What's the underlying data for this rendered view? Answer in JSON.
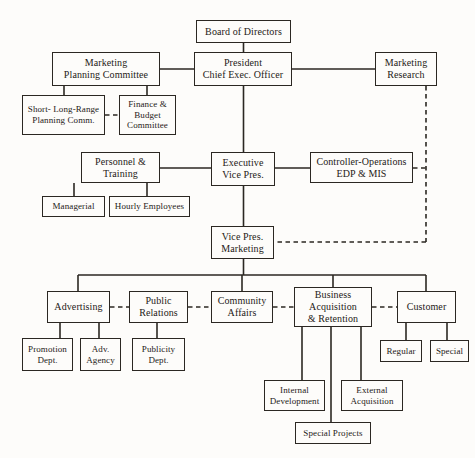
{
  "diagram": {
    "type": "organization-chart",
    "canvas": {
      "width": 475,
      "height": 458
    },
    "colors": {
      "background": "#fdfcfa",
      "line": "#2b2722",
      "text": "#1d1a17",
      "box_fill": "#fdfcfa"
    },
    "line_styles": {
      "solid": "solid reporting line",
      "dashed": "dashed coordination / staff line"
    }
  },
  "nodes": {
    "board_of_directors": {
      "label": "Board of Directors",
      "x": 196,
      "y": 20,
      "w": 95,
      "h": 23,
      "font": "fs-10"
    },
    "president": {
      "label": "President\nChief Exec. Officer",
      "x": 194,
      "y": 52,
      "w": 98,
      "h": 34,
      "font": "fs-10"
    },
    "marketing_planning_committee": {
      "label": "Marketing\nPlanning Committee",
      "x": 52,
      "y": 52,
      "w": 108,
      "h": 34,
      "font": "fs-10"
    },
    "marketing_research": {
      "label": "Marketing\nResearch",
      "x": 375,
      "y": 52,
      "w": 62,
      "h": 34,
      "font": "fs-10"
    },
    "short_long_range_planning": {
      "label": "Short- Long-Range\nPlanning Comm.",
      "x": 22,
      "y": 95,
      "w": 83,
      "h": 40,
      "font": "fs-9"
    },
    "finance_budget_committee": {
      "label": "Finance &\nBudget\nCommittee",
      "x": 119,
      "y": 95,
      "w": 57,
      "h": 40,
      "font": "fs-9"
    },
    "personnel_training": {
      "label": "Personnel &\nTraining",
      "x": 81,
      "y": 152,
      "w": 79,
      "h": 31,
      "font": "fs-10"
    },
    "executive_vice_pres": {
      "label": "Executive\nVice Pres.",
      "x": 211,
      "y": 152,
      "w": 64,
      "h": 34,
      "font": "fs-10"
    },
    "controller_operations": {
      "label": "Controller-Operations\nEDP & MIS",
      "x": 310,
      "y": 152,
      "w": 103,
      "h": 31,
      "font": "fs-10"
    },
    "managerial": {
      "label": "Managerial",
      "x": 42,
      "y": 196,
      "w": 63,
      "h": 21,
      "font": "fs-9"
    },
    "hourly_employees": {
      "label": "Hourly Employees",
      "x": 109,
      "y": 196,
      "w": 81,
      "h": 21,
      "font": "fs-9"
    },
    "vice_pres_marketing": {
      "label": "Vice Pres.\nMarketing",
      "x": 211,
      "y": 226,
      "w": 63,
      "h": 33,
      "font": "fs-10"
    },
    "advertising": {
      "label": "Advertising",
      "x": 47,
      "y": 291,
      "w": 63,
      "h": 32,
      "font": "fs-10"
    },
    "public_relations": {
      "label": "Public\nRelations",
      "x": 129,
      "y": 291,
      "w": 59,
      "h": 32,
      "font": "fs-10"
    },
    "community_affairs": {
      "label": "Community\nAffairs",
      "x": 211,
      "y": 291,
      "w": 62,
      "h": 32,
      "font": "fs-10"
    },
    "business_acquisition_retention": {
      "label": "Business\nAcquisition\n& Retention",
      "x": 294,
      "y": 287,
      "w": 78,
      "h": 40,
      "font": "fs-10"
    },
    "customer": {
      "label": "Customer",
      "x": 397,
      "y": 291,
      "w": 59,
      "h": 32,
      "font": "fs-10"
    },
    "promotion_dept": {
      "label": "Promotion\nDept.",
      "x": 22,
      "y": 338,
      "w": 51,
      "h": 33,
      "font": "fs-9"
    },
    "adv_agency": {
      "label": "Adv.\nAgency",
      "x": 80,
      "y": 338,
      "w": 41,
      "h": 33,
      "font": "fs-9"
    },
    "publicity_dept": {
      "label": "Publicity\nDept.",
      "x": 132,
      "y": 338,
      "w": 53,
      "h": 33,
      "font": "fs-9"
    },
    "regular": {
      "label": "Regular",
      "x": 380,
      "y": 340,
      "w": 42,
      "h": 22,
      "font": "fs-9"
    },
    "special": {
      "label": "Special",
      "x": 430,
      "y": 340,
      "w": 39,
      "h": 22,
      "font": "fs-9"
    },
    "internal_development": {
      "label": "Internal\nDevelopment",
      "x": 264,
      "y": 380,
      "w": 61,
      "h": 31,
      "font": "fs-9"
    },
    "external_acquisition": {
      "label": "External\nAcquisition",
      "x": 341,
      "y": 380,
      "w": 62,
      "h": 31,
      "font": "fs-9"
    },
    "special_projects": {
      "label": "Special Projects",
      "x": 295,
      "y": 422,
      "w": 76,
      "h": 22,
      "font": "fs-9"
    }
  },
  "edges": [
    {
      "name": "board-to-president",
      "style": "solid",
      "d": "M 243.5 43 L 243.5 52"
    },
    {
      "name": "president-to-marketing-planning-committee",
      "style": "solid",
      "d": "M 194 69 L 160 69"
    },
    {
      "name": "president-to-marketing-research",
      "style": "solid",
      "d": "M 292 69 L 375 69"
    },
    {
      "name": "marketing-planning-to-short-long-range",
      "style": "solid",
      "d": "M 64 86 L 64 95"
    },
    {
      "name": "marketing-planning-to-finance-budget",
      "style": "solid",
      "d": "M 147 86 L 147 95"
    },
    {
      "name": "short-long-range-to-finance-budget",
      "style": "dashed",
      "d": "M 105 115 L 119 115"
    },
    {
      "name": "president-to-executive-vice-pres",
      "style": "solid",
      "d": "M 243.5 86 L 243.5 152"
    },
    {
      "name": "executive-vp-to-personnel-training",
      "style": "solid",
      "d": "M 211 168 L 160 168"
    },
    {
      "name": "executive-vp-to-controller-operations",
      "style": "solid",
      "d": "M 275 168 L 310 168"
    },
    {
      "name": "personnel-to-managerial",
      "style": "solid",
      "d": "M 74 183 L 74 196"
    },
    {
      "name": "personnel-to-hourly-employees",
      "style": "solid",
      "d": "M 147 183 L 147 196"
    },
    {
      "name": "executive-vp-to-vice-pres-marketing",
      "style": "solid",
      "d": "M 243.5 186 L 243.5 226"
    },
    {
      "name": "marketing-research-dashed-down",
      "style": "dashed",
      "d": "M 426 86 L 426 242"
    },
    {
      "name": "controller-operations-to-dashed-trunk",
      "style": "dashed",
      "d": "M 413 168 L 426 168"
    },
    {
      "name": "dashed-trunk-to-vice-pres-marketing",
      "style": "dashed",
      "d": "M 426 242 L 274 242"
    },
    {
      "name": "vice-pres-marketing-to-bus",
      "style": "solid",
      "d": "M 243.5 259 L 243.5 275"
    },
    {
      "name": "bus-bar",
      "style": "solid",
      "d": "M 78 275 L 426 275"
    },
    {
      "name": "bus-to-advertising",
      "style": "solid",
      "d": "M 78 275 L 78 291"
    },
    {
      "name": "bus-to-community-affairs",
      "style": "solid",
      "d": "M 242 275 L 242 291"
    },
    {
      "name": "bus-to-business-acquisition",
      "style": "solid",
      "d": "M 333 275 L 333 287"
    },
    {
      "name": "bus-to-customer",
      "style": "solid",
      "d": "M 426 275 L 426 291"
    },
    {
      "name": "advertising-to-public-relations",
      "style": "dashed",
      "d": "M 110 307 L 129 307"
    },
    {
      "name": "public-relations-to-community-affairs",
      "style": "dashed",
      "d": "M 188 307 L 211 307"
    },
    {
      "name": "community-affairs-to-business-acquisition",
      "style": "dashed",
      "d": "M 273 307 L 294 307"
    },
    {
      "name": "business-acquisition-to-customer",
      "style": "dashed",
      "d": "M 372 307 L 397 307"
    },
    {
      "name": "advertising-to-promotion-dept",
      "style": "solid",
      "d": "M 60 323 L 60 338"
    },
    {
      "name": "advertising-to-adv-agency",
      "style": "solid",
      "d": "M 99 323 L 99 338"
    },
    {
      "name": "public-relations-to-publicity-dept",
      "style": "solid",
      "d": "M 157 323 L 157 338"
    },
    {
      "name": "customer-to-regular",
      "style": "solid",
      "d": "M 406 323 L 406 340"
    },
    {
      "name": "customer-to-special",
      "style": "solid",
      "d": "M 447 323 L 447 340"
    },
    {
      "name": "business-acquisition-to-internal-development",
      "style": "solid",
      "d": "M 302 327 L 302 380"
    },
    {
      "name": "business-acquisition-to-external-acquisition",
      "style": "solid",
      "d": "M 361 327 L 361 380"
    },
    {
      "name": "business-acquisition-to-special-projects",
      "style": "solid",
      "d": "M 331 327 L 331 422"
    }
  ]
}
